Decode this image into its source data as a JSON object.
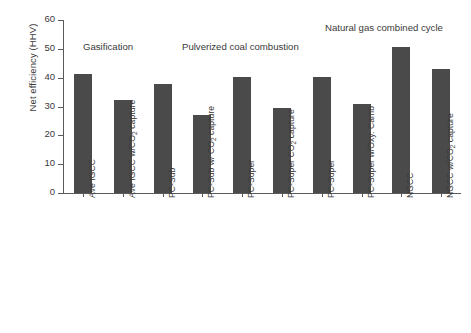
{
  "chart_data": {
    "type": "bar",
    "title": "",
    "xlabel": "",
    "ylabel": "Net efficiency (HHV)",
    "ylim": [
      0,
      60
    ],
    "ytick_values": [
      0,
      10,
      20,
      30,
      40,
      50,
      60
    ],
    "ytick_labels": [
      "0",
      "10",
      "20",
      "30",
      "40",
      "50",
      "60"
    ],
    "grid": false,
    "legend": "none",
    "bar_color": "#4a4a4a",
    "axis_color": "#5a5a5a",
    "text_color": "#3a3a3a",
    "categories": [
      "Ave IGCC",
      "Ave IGCC w/CO₂ capture",
      "PC-Sub",
      "PC-Sub w/ CO₂ capture",
      "PC-Super",
      "PC-Super CO₂ capture",
      "PC-Super",
      "PC-Super w/Oxy. Camb",
      "NGCC",
      "NGCC w/CO₂ capture"
    ],
    "category_parts": [
      {
        "pre": "Ave IGCC",
        "sub": "",
        "post": ""
      },
      {
        "pre": "Ave IGCC w/CO",
        "sub": "2",
        "post": " capture"
      },
      {
        "pre": "PC-Sub",
        "sub": "",
        "post": ""
      },
      {
        "pre": "PC-Sub w/ CO",
        "sub": "2",
        "post": " capture"
      },
      {
        "pre": "PC-Super",
        "sub": "",
        "post": ""
      },
      {
        "pre": "PC-Super CO",
        "sub": "2",
        "post": " capture"
      },
      {
        "pre": "PC-Super",
        "sub": "",
        "post": ""
      },
      {
        "pre": "PC-Super w/Oxy. Camb",
        "sub": "",
        "post": ""
      },
      {
        "pre": "NGCC",
        "sub": "",
        "post": ""
      },
      {
        "pre": "NGCC w/CO",
        "sub": "2",
        "post": " capture"
      }
    ],
    "values": [
      41.3,
      32.2,
      37.7,
      26.9,
      40.3,
      29.4,
      40.4,
      30.8,
      50.8,
      43.1
    ]
  },
  "annotations": [
    {
      "text": "Gasification",
      "left": 83,
      "top": 41
    },
    {
      "text": "Pulverized coal combustion",
      "left": 182,
      "top": 41
    },
    {
      "text": "Natural gas combined cycle",
      "left": 325,
      "top": 22
    }
  ]
}
